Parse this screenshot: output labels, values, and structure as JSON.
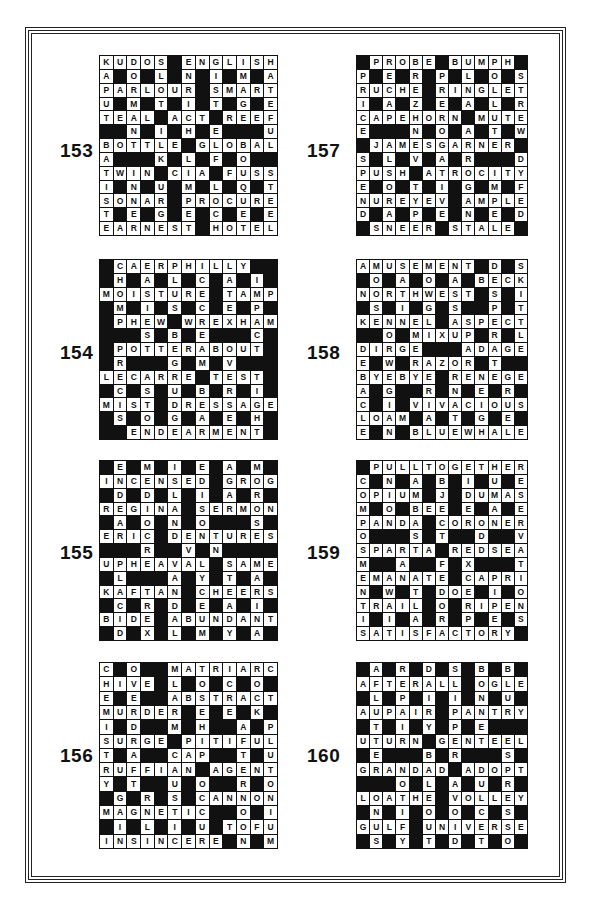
{
  "puzzles": [
    {
      "number": "153",
      "rows": [
        "KUDOS#ENGLISH",
        "A#O#L#N#I#M#A",
        "PARLOUR#SMART",
        "U#M#T#I#T#G#E",
        "TEAL#ACT#REEF",
        "##N#I#H#E###U",
        "BOTTLE#GLOBAL",
        "A###K#L#F#O##",
        "TWIN#CIA#FUSS",
        "I#N#U#M#L#Q#T",
        "SONAR#PROCURE",
        "T#E#G#E#C#E#E",
        "EARNEST#HOTEL"
      ]
    },
    {
      "number": "157",
      "rows": [
        "#PROBE#BUMPH#",
        "P#E#R#P#L#O#S",
        "RUCHE#RINGLET",
        "I#A#Z#E#A#L#R",
        "CAPEHORN#MUTE",
        "E###N#O#A#T#W",
        "#JAMESGARNER#",
        "S#L#V#A#R###D",
        "PUSH#ATROCITY",
        "E#O#T#I#G#M#F",
        "NUREYEV#AMPLE",
        "D#A#P#E#N#E#D",
        "#SNEER#STALE#"
      ]
    },
    {
      "number": "154",
      "rows": [
        "#CAERPHILLY##",
        "#H#A#L#C#A#I#",
        "MOISTURE#TAMP",
        "#M#I#S#C#E#P#",
        "#PHEW#WREXHAM",
        "###S#B#E###C#",
        "#POTTERABOUT#",
        "#R###G#M#V###",
        "LECARRE#TEST#",
        "#C#S#U#B#R#I#",
        "MIST#DRESSAGE",
        "#S#O#G#A#E#H#",
        "##ENDEARMENT#"
      ]
    },
    {
      "number": "158",
      "rows": [
        "AMUSEMENT#D#S",
        "#O#A#O#A#BECK",
        "NORTHWEST#S#I",
        "#S#I#G#S##P#T",
        "KENNEL#ASPECT",
        "##O#MIXUP#R#L",
        "DIRGE###ADAGE",
        "E#W#RAZOR#T##",
        "BYEBYE#RENEGE",
        "A#G##R#N#E#R#",
        "C#I#VIVACIOUS",
        "LOAM#A#T#G#E#",
        "E#N#BLUEWHALE"
      ]
    },
    {
      "number": "155",
      "rows": [
        "#E#M#I#E#A#M#",
        "INCENSED#GROG",
        "#D#D#L#I#A#R#",
        "REGINA#SERMON",
        "#A#O#N#O###S#",
        "ERIC#DENTURES",
        "###R##V#N####",
        "UPHEAVAL#SAME",
        "#L###A#Y#T#A#",
        "KAFTAN#CHEERS",
        "#C#R#D#E#A#I#",
        "BIDE#ABUNDANT",
        "#D#X#L#M#Y#A#"
      ]
    },
    {
      "number": "159",
      "rows": [
        "#PULLTOGETHER",
        "C#N#A#B#I#U#E",
        "OPIUM#J#DUMAS",
        "M#O#BEE#E#A#E",
        "PANDA#CORONER",
        "O###S#T##D##V",
        "SPARTA#REDSEA",
        "M##A##F#X###T",
        "EMANATE#CAPRI",
        "N#W#T#DOE#I#O",
        "TRAIL#O#RIPEN",
        "I#I#A#R#P#E#S",
        "SATISFACTORY#"
      ]
    },
    {
      "number": "156",
      "rows": [
        "C#O##MATRIARCH",
        "HIVE#L#O#C#O#",
        "E#E##ABSTRACT",
        "MURDER#E#E#K#",
        "I#D##M#H##A#P",
        "SURGE#PITIFUL",
        "T#A##CAP##T#U",
        "RUFFIAN#AGENT",
        "Y#T##U#O##R#O",
        "#G#R#S#CANNON",
        "MAGNETIC##O#I",
        "#I#L#I#U#TOFU",
        "INSINCERE#N#M"
      ]
    },
    {
      "number": "160",
      "rows": [
        "#A#R#D#S#B#B#",
        "AFTERALL#OGLE",
        "#L#P#I#I#N#U#",
        "AUPAIR#PANTRY",
        "#T#I#Y#P#E###",
        "UTURN#GENTEEL",
        "#E###B#R###S#",
        "GRANDAD#ADOPT",
        "###O#L#A#U#R#",
        "LOATHE#VOLLEY",
        "#N#I#O#O#C#S#",
        "GULF#UNIVERSE",
        "#S#Y#T#D#T#O#"
      ]
    }
  ]
}
